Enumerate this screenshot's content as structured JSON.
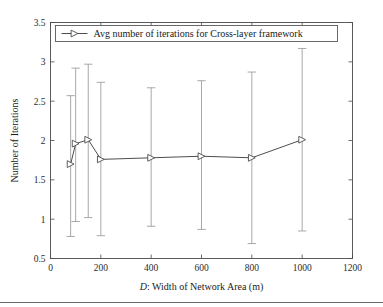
{
  "chart_data": {
    "type": "line",
    "title": "",
    "subtitle": "",
    "xlabel_prefix": "D",
    "xlabel_rest": ": Width of Network Area (m)",
    "xlabel": "D: Width of Network Area (m)",
    "ylabel": "Number of Iterations",
    "xlim": [
      0,
      1200
    ],
    "ylim": [
      0.5,
      3.5
    ],
    "xticks": [
      0,
      200,
      400,
      600,
      800,
      1000,
      1200
    ],
    "xtick_labels": [
      "0",
      "200",
      "400",
      "600",
      "800",
      "1000",
      "1200"
    ],
    "yticks": [
      0.5,
      1,
      1.5,
      2,
      2.5,
      3,
      3.5
    ],
    "ytick_labels": [
      "0.5",
      "1",
      "1.5",
      "2",
      "2.5",
      "3",
      "3.5"
    ],
    "grid": false,
    "legend_position": "top",
    "marker": "right-triangle",
    "line_color": "#4d4d4d",
    "errorbar_color": "#9a9a9a",
    "series": [
      {
        "name": "Avg number of iterations for Cross-layer framework",
        "x": [
          80,
          100,
          150,
          200,
          400,
          600,
          800,
          1000
        ],
        "values": [
          1.7,
          1.96,
          2.01,
          1.76,
          1.78,
          1.8,
          1.78,
          2.01
        ],
        "err_upper": [
          2.57,
          2.92,
          2.97,
          2.74,
          2.67,
          2.76,
          2.87,
          3.17
        ],
        "err_lower": [
          0.78,
          0.97,
          1.02,
          0.79,
          0.91,
          0.87,
          0.69,
          0.85
        ]
      }
    ]
  },
  "legend": {
    "entries": [
      {
        "label": "Avg number of iterations for Cross-layer framework"
      }
    ]
  }
}
